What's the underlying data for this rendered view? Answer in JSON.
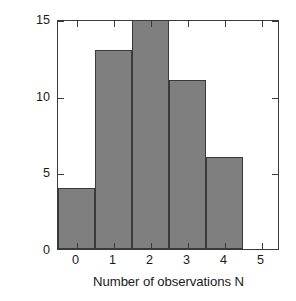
{
  "chart_data": {
    "type": "bar",
    "title": "",
    "xlabel": "Number of observations N",
    "ylabel": "Subareas with N observations",
    "categories": [
      "0",
      "1",
      "2",
      "3",
      "4"
    ],
    "values": [
      4,
      13,
      15,
      11,
      6
    ],
    "bar_color": "#7f7f7f",
    "edge_color": "#3a3a3a",
    "xlim": [
      -0.5,
      5.5
    ],
    "ylim": [
      0,
      15
    ],
    "xticks": [
      "0",
      "1",
      "2",
      "3",
      "4",
      "5"
    ],
    "xtick_values": [
      0,
      1,
      2,
      3,
      4,
      5
    ],
    "yticks": [
      "0",
      "5",
      "10",
      "15"
    ],
    "ytick_values": [
      0,
      5,
      10,
      15
    ],
    "grid": false,
    "legend": null,
    "bin_width": 1,
    "note": "Histogram of subarea counts versus number of observations N"
  }
}
